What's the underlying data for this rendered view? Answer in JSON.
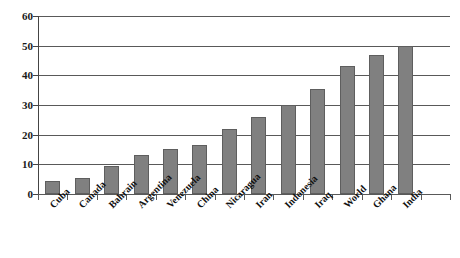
{
  "chart_data": {
    "type": "bar",
    "title": "",
    "subtitle": "",
    "xlabel": "",
    "ylabel": "",
    "ylim": [
      0,
      60
    ],
    "yticks": [
      0,
      10,
      20,
      30,
      40,
      50,
      60
    ],
    "grid": true,
    "legend": false,
    "orientation": "vertical",
    "bar_color": "#808080",
    "bar_edge_color": "#5e5e5e",
    "gridline_color": "#595959",
    "axis_color": "#444444",
    "categories": [
      "Cuba",
      "Canada",
      "Bahrain",
      "Argentina",
      "Venezuela",
      "China",
      "Nicaragua",
      "Iran",
      "Indonesia",
      "Iraq",
      "World",
      "Ghana",
      "India"
    ],
    "values": [
      4.5,
      5.3,
      9.6,
      13.0,
      15.3,
      16.6,
      21.8,
      26.0,
      30.0,
      35.5,
      43.0,
      46.7,
      50.0
    ]
  }
}
